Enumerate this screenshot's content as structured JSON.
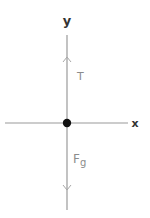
{
  "diagram": {
    "type": "free-body-diagram",
    "axes": {
      "y_label": "y",
      "x_label": "x"
    },
    "forces": [
      {
        "name": "tension",
        "label": "T",
        "direction": "up"
      },
      {
        "name": "gravity",
        "label_main": "F",
        "label_sub": "g",
        "direction": "down"
      }
    ],
    "colors": {
      "axis_line": "#9a9a9a",
      "axis_label": "#333333",
      "force_label": "#8c8c8c",
      "origin_dot": "#111111",
      "background": "#ffffff"
    }
  }
}
